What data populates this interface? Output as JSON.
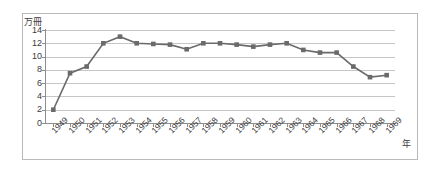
{
  "chart_data": {
    "type": "line",
    "title": "",
    "subtitle": "",
    "xlabel": "年",
    "ylabel": "万冊",
    "ylim": [
      0,
      14
    ],
    "xlim": [
      1949,
      1969
    ],
    "yticks": [
      0,
      2,
      4,
      6,
      8,
      10,
      12,
      14
    ],
    "grid": true,
    "legend": false,
    "marker": "square",
    "series_color": "#6a6a6a",
    "gridline_color": "#c6c6c6",
    "axis_color": "#8d8d8d",
    "categories": [
      "1949",
      "1950",
      "1951",
      "1952",
      "1953",
      "1954",
      "1955",
      "1956",
      "1957",
      "1958",
      "1959",
      "1960",
      "1961",
      "1962",
      "1963",
      "1964",
      "1965",
      "1966",
      "1967",
      "1968",
      "1969"
    ],
    "values": [
      2.0,
      7.5,
      8.5,
      12.0,
      13.0,
      12.0,
      11.9,
      11.8,
      11.1,
      12.0,
      12.0,
      11.8,
      11.5,
      11.8,
      12.0,
      11.0,
      10.6,
      10.6,
      8.5,
      6.9,
      7.2
    ],
    "series": [
      {
        "name": "蔵書冊数",
        "values": [
          2.0,
          7.5,
          8.5,
          12.0,
          13.0,
          12.0,
          11.9,
          11.8,
          11.1,
          12.0,
          12.0,
          11.8,
          11.5,
          11.8,
          12.0,
          11.0,
          10.6,
          10.6,
          8.5,
          6.9,
          7.2
        ]
      }
    ]
  },
  "axes": {
    "y_title": "万冊",
    "x_title": "年",
    "y_tick_labels": [
      "14",
      "12",
      "10",
      "8",
      "6",
      "4",
      "2",
      "0"
    ],
    "x_tick_labels": [
      "1949",
      "1950",
      "1951",
      "1952",
      "1953",
      "1954",
      "1955",
      "1956",
      "1957",
      "1958",
      "1959",
      "1960",
      "1961",
      "1962",
      "1963",
      "1964",
      "1965",
      "1966",
      "1967",
      "1968",
      "1969"
    ]
  }
}
